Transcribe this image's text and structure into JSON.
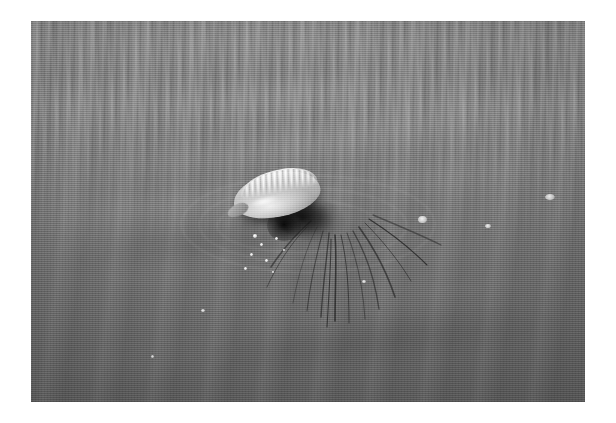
{
  "image": {
    "title": "Portuguese man o' war floating at the ocean surface",
    "medium": "grayscale photograph",
    "orientation": "landscape",
    "border": "white photographic border",
    "frame": {
      "x": 31,
      "y": 21,
      "width": 554,
      "height": 381
    },
    "canvas": {
      "width": 616,
      "height": 423
    }
  },
  "palette": {
    "border": "#ffffff",
    "water_top": "#8d8d8d",
    "water_mid": "#797979",
    "water_bottom": "#646464",
    "float_highlight": "#f2f2f2",
    "float_body": "#c6c6c6",
    "float_shade": "#8f8f8f",
    "tentacle_dark": "#141414",
    "droplet": "#ffffff"
  },
  "subject": {
    "name": "portuguese-man-o-war",
    "common_label": "Portuguese man o' war",
    "parts": [
      {
        "name": "float",
        "label": "gas-filled float (pneumatophore)",
        "x": 246,
        "y": 195,
        "width": 88,
        "height": 44,
        "tone": "#c6c6c6"
      },
      {
        "name": "crest",
        "label": "ridged dorsal crest",
        "x": 247,
        "y": 182,
        "width": 78,
        "height": 24,
        "tone": "#f0f0f0"
      },
      {
        "name": "tip",
        "label": "tapered lower tip",
        "x": 227,
        "y": 210,
        "width": 22,
        "height": 12,
        "tone": "#9a9a9a"
      },
      {
        "name": "tentacle-mass",
        "label": "dark tentacle cluster",
        "x": 275,
        "y": 208,
        "width": 72,
        "height": 44,
        "tone": "#1a1a1a"
      },
      {
        "name": "tentacles",
        "label": "trailing tentacles",
        "count": 14,
        "direction": "down and to the right"
      }
    ]
  },
  "scene": {
    "background_label": "rippled sea surface",
    "lighting": "diffuse overcast daylight from upper left",
    "wave_bands": [
      {
        "name": "fine-chop-band",
        "label": "fine horizontal chop",
        "region": "upper third"
      },
      {
        "name": "diagonal-swell-band",
        "label": "diagonal swell bands",
        "region": "middle",
        "angle_deg": 97
      },
      {
        "name": "smooth-trough",
        "label": "smooth dark trough",
        "region": "lower third"
      }
    ],
    "crest_highlights": [
      {
        "name": "crest-highlight-1",
        "x": 120,
        "y": 58,
        "width": 300,
        "height": 26,
        "opacity": 0.1
      },
      {
        "name": "crest-highlight-2",
        "x": 40,
        "y": 118,
        "width": 420,
        "height": 22,
        "opacity": 0.12
      },
      {
        "name": "crest-highlight-3",
        "x": 180,
        "y": 96,
        "width": 340,
        "height": 18,
        "opacity": 0.09
      },
      {
        "name": "crest-highlight-4",
        "x": 0,
        "y": 168,
        "width": 320,
        "height": 30,
        "opacity": 0.11
      },
      {
        "name": "crest-highlight-5",
        "x": 250,
        "y": 148,
        "width": 300,
        "height": 20,
        "opacity": 0.08
      },
      {
        "name": "crest-highlight-6",
        "x": 60,
        "y": 226,
        "width": 260,
        "height": 22,
        "opacity": 0.07
      },
      {
        "name": "crest-highlight-7",
        "x": 300,
        "y": 262,
        "width": 240,
        "height": 18,
        "opacity": 0.06
      },
      {
        "name": "crest-shadow-1",
        "x": 0,
        "y": 206,
        "width": 400,
        "height": 34,
        "opacity": 0.1,
        "dark": true
      },
      {
        "name": "crest-shadow-2",
        "x": 150,
        "y": 300,
        "width": 400,
        "height": 40,
        "opacity": 0.09,
        "dark": true
      },
      {
        "name": "crest-highlight-8",
        "x": 20,
        "y": 330,
        "width": 200,
        "height": 16,
        "opacity": 0.05
      }
    ],
    "foam_specks": [
      {
        "name": "foam-speck-1",
        "x": 387,
        "y": 195,
        "width": 9,
        "height": 7
      },
      {
        "name": "foam-speck-2",
        "x": 454,
        "y": 203,
        "width": 6,
        "height": 4
      },
      {
        "name": "foam-speck-3",
        "x": 514,
        "y": 173,
        "width": 10,
        "height": 6
      },
      {
        "name": "foam-speck-4",
        "x": 170,
        "y": 288,
        "width": 4,
        "height": 3
      },
      {
        "name": "foam-speck-5",
        "x": 331,
        "y": 259,
        "width": 4,
        "height": 3
      },
      {
        "name": "foam-speck-6",
        "x": 120,
        "y": 334,
        "width": 3,
        "height": 3
      }
    ],
    "splash_droplets": [
      {
        "name": "splash-droplet-1",
        "x": 222,
        "y": 213,
        "size": 4
      },
      {
        "name": "splash-droplet-2",
        "x": 229,
        "y": 222,
        "size": 3
      },
      {
        "name": "splash-droplet-3",
        "x": 219,
        "y": 232,
        "size": 3
      },
      {
        "name": "splash-droplet-4",
        "x": 234,
        "y": 238,
        "size": 3
      },
      {
        "name": "splash-droplet-5",
        "x": 244,
        "y": 216,
        "size": 3
      },
      {
        "name": "splash-droplet-6",
        "x": 252,
        "y": 228,
        "size": 2
      },
      {
        "name": "splash-droplet-7",
        "x": 213,
        "y": 246,
        "size": 3
      },
      {
        "name": "splash-droplet-8",
        "x": 241,
        "y": 250,
        "size": 2
      }
    ],
    "tentacle_paths": [
      "M 286 206 C 276 226, 268 250, 262 282",
      "M 292 210 C 286 232, 280 256, 276 290",
      "M 298 212 C 296 236, 292 262, 290 296",
      "M 304 214 C 306 238, 304 266, 304 300",
      "M 310 214 C 316 240, 318 268, 318 302",
      "M 316 212 C 326 238, 332 266, 334 298",
      "M 322 210 C 336 234, 344 260, 348 288",
      "M 328 206 C 344 228, 356 252, 364 276",
      "M 334 202 C 352 220, 368 240, 380 260",
      "M 338 198 C 360 212, 380 228, 396 244",
      "M 342 194 C 366 204, 390 214, 410 224",
      "M 280 200 C 266 212, 252 228, 240 246",
      "M 276 206 C 260 222, 246 244, 236 266",
      "M 300 218 C 300 244, 298 272, 296 306"
    ],
    "ripple_rings": [
      {
        "name": "surface-ripple-1",
        "x": 186,
        "y": 178,
        "width": 160,
        "height": 52
      },
      {
        "name": "surface-ripple-2",
        "x": 168,
        "y": 166,
        "width": 206,
        "height": 74
      },
      {
        "name": "surface-ripple-3",
        "x": 150,
        "y": 154,
        "width": 252,
        "height": 96
      }
    ]
  }
}
